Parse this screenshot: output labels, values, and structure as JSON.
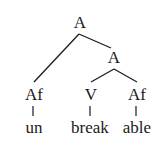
{
  "tree": {
    "root": {
      "label": "A"
    },
    "right_node": {
      "label": "A"
    },
    "leaves": [
      {
        "category": "Af",
        "word": "un"
      },
      {
        "category": "V",
        "word": "break"
      },
      {
        "category": "Af",
        "word": "able"
      }
    ]
  }
}
